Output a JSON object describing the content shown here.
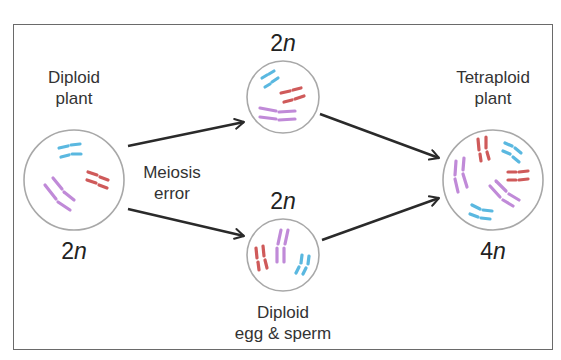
{
  "diagram": {
    "colors": {
      "chromosome_red": "#cf5a5a",
      "chromosome_blue": "#5ab8e0",
      "chromosome_purple": "#c08ad8",
      "cell_outline": "#a8a8a8",
      "arrow": "#2a2a2a",
      "text": "#333333"
    },
    "nodes": {
      "diploid_plant": {
        "label_line1": "Diploid",
        "label_line2": "plant",
        "ploidy_num": "2",
        "ploidy_var": "n"
      },
      "gamete_top": {
        "ploidy_num": "2",
        "ploidy_var": "n"
      },
      "gamete_bottom": {
        "ploidy_num": "2",
        "ploidy_var": "n",
        "label_line1": "Diploid",
        "label_line2": "egg & sperm"
      },
      "tetraploid_plant": {
        "label_line1": "Tetraploid",
        "label_line2": "plant",
        "ploidy_num": "4",
        "ploidy_var": "n"
      }
    },
    "edges": [
      {
        "from": "diploid_plant",
        "to": "gamete_top"
      },
      {
        "from": "diploid_plant",
        "to": "gamete_bottom"
      },
      {
        "from": "gamete_top",
        "to": "tetraploid_plant"
      },
      {
        "from": "gamete_bottom",
        "to": "tetraploid_plant"
      }
    ],
    "process_label_line1": "Meiosis",
    "process_label_line2": "error"
  }
}
